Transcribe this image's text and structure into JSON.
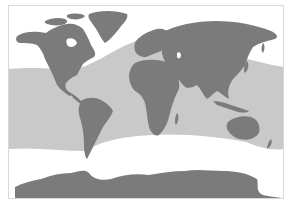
{
  "map": {
    "projection": "world-equirectangular",
    "colors": {
      "background": "#ffffff",
      "frame": "#d8d8d8",
      "shaded_band": "#c9c9c9",
      "land": "#7b7b7b"
    },
    "regions": [
      {
        "name": "North America"
      },
      {
        "name": "Greenland"
      },
      {
        "name": "South America"
      },
      {
        "name": "Europe"
      },
      {
        "name": "Africa"
      },
      {
        "name": "Asia"
      },
      {
        "name": "Australia"
      },
      {
        "name": "Antarctica"
      }
    ],
    "shaded_band": {
      "description": "Shaded zone covering tropical and subtropical oceans"
    }
  }
}
